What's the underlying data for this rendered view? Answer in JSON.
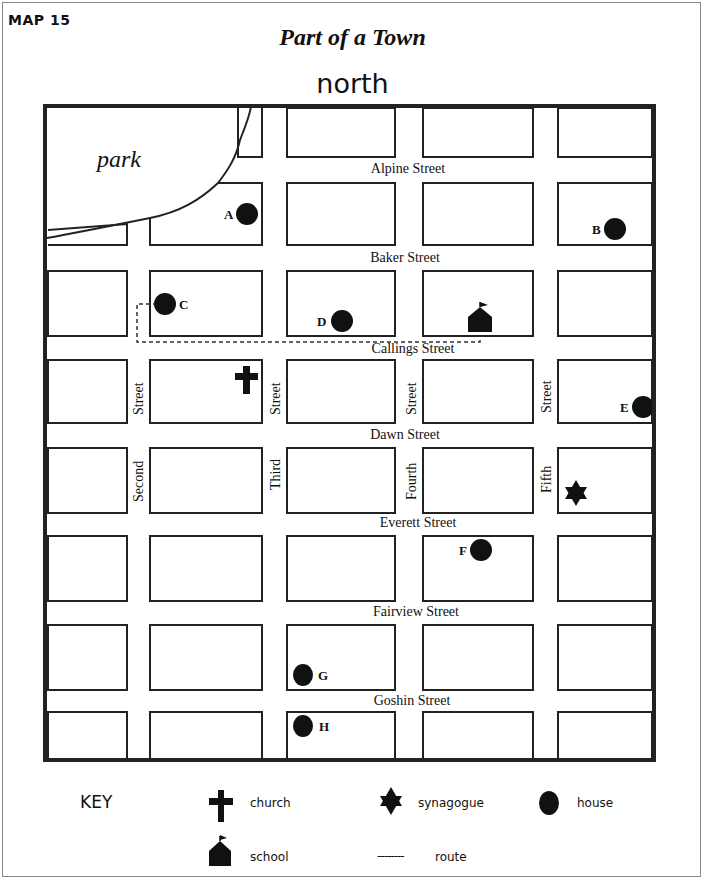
{
  "header": {
    "map_number": "MAP 15",
    "title": "Part of a Town",
    "orientation": "north"
  },
  "park": {
    "label": "park"
  },
  "streets": {
    "horizontal": [
      {
        "name": "Alpine Street",
        "x": 408,
        "y": 162
      },
      {
        "name": "Baker Street",
        "x": 405,
        "y": 251
      },
      {
        "name": "Callings Street",
        "x": 413,
        "y": 342
      },
      {
        "name": "Dawn Street",
        "x": 405,
        "y": 428
      },
      {
        "name": "Everett Street",
        "x": 418,
        "y": 516
      },
      {
        "name": "Fairview Street",
        "x": 416,
        "y": 605
      },
      {
        "name": "Goshin Street",
        "x": 412,
        "y": 694
      }
    ],
    "vertical": [
      {
        "name_top": "Street",
        "name_bottom": "Second",
        "x": 133
      },
      {
        "name_top": "Street",
        "name_bottom": "Third",
        "x": 270
      },
      {
        "name_top": "Street",
        "name_bottom": "Fourth",
        "x": 406
      },
      {
        "name_top": "Street",
        "name_bottom": "Fifth",
        "x": 541
      }
    ]
  },
  "houses": [
    {
      "label": "A",
      "cx": 247,
      "cy": 214,
      "label_side": "left"
    },
    {
      "label": "B",
      "cx": 615,
      "cy": 229,
      "label_side": "left"
    },
    {
      "label": "C",
      "cx": 165,
      "cy": 304,
      "label_side": "right"
    },
    {
      "label": "D",
      "cx": 342,
      "cy": 321,
      "label_side": "left"
    },
    {
      "label": "E",
      "cx": 643,
      "cy": 407,
      "label_side": "left"
    },
    {
      "label": "F",
      "cx": 481,
      "cy": 550,
      "label_side": "left"
    },
    {
      "label": "G",
      "cx": 303,
      "cy": 675,
      "label_side": "right"
    },
    {
      "label": "H",
      "cx": 303,
      "cy": 726,
      "label_side": "right"
    }
  ],
  "landmarks": {
    "church": {
      "x": 246,
      "y": 380
    },
    "school": {
      "x": 480,
      "y": 320
    },
    "synagogue": {
      "x": 576,
      "y": 493
    }
  },
  "route": {
    "description": "dashed route from house C to school"
  },
  "key": {
    "title": "KEY",
    "items": [
      {
        "symbol": "church-icon",
        "label": "church"
      },
      {
        "symbol": "synagogue-icon",
        "label": "synagogue"
      },
      {
        "symbol": "house-icon",
        "label": "house"
      },
      {
        "symbol": "school-icon",
        "label": "school"
      },
      {
        "symbol": "route-line",
        "label": "route",
        "glyph": "--------"
      }
    ]
  },
  "colors": {
    "ink": "#111111",
    "background": "#ffffff"
  }
}
